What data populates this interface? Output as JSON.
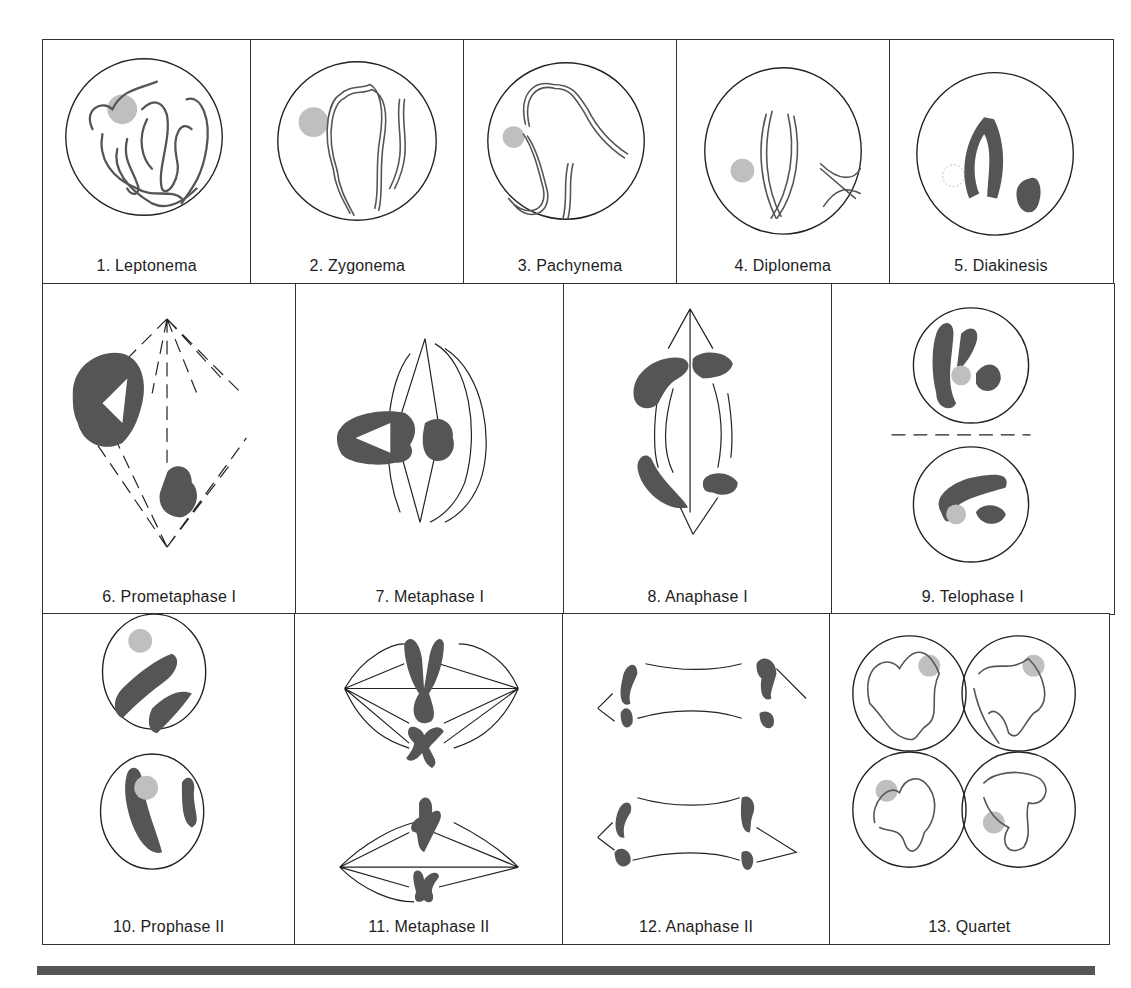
{
  "figure": {
    "rows": [
      {
        "stages": [
          {
            "number": 1,
            "label": "1. Leptonema"
          },
          {
            "number": 2,
            "label": "2. Zygonema"
          },
          {
            "number": 3,
            "label": "3. Pachynema"
          },
          {
            "number": 4,
            "label": "4. Diplonema"
          },
          {
            "number": 5,
            "label": "5. Diakinesis"
          }
        ]
      },
      {
        "stages": [
          {
            "number": 6,
            "label": "6. Prometaphase I"
          },
          {
            "number": 7,
            "label": "7. Metaphase I"
          },
          {
            "number": 8,
            "label": "8. Anaphase I"
          },
          {
            "number": 9,
            "label": "9. Telophase I"
          }
        ]
      },
      {
        "stages": [
          {
            "number": 10,
            "label": "10. Prophase II"
          },
          {
            "number": 11,
            "label": "11. Metaphase II"
          },
          {
            "number": 12,
            "label": "12. Anaphase II"
          },
          {
            "number": 13,
            "label": "13. Quartet"
          }
        ]
      }
    ],
    "colors": {
      "chromosome": "#555555",
      "nucleolus": "#bfbfbf",
      "outline": "#222222",
      "bottom_rule": "#555555"
    }
  }
}
